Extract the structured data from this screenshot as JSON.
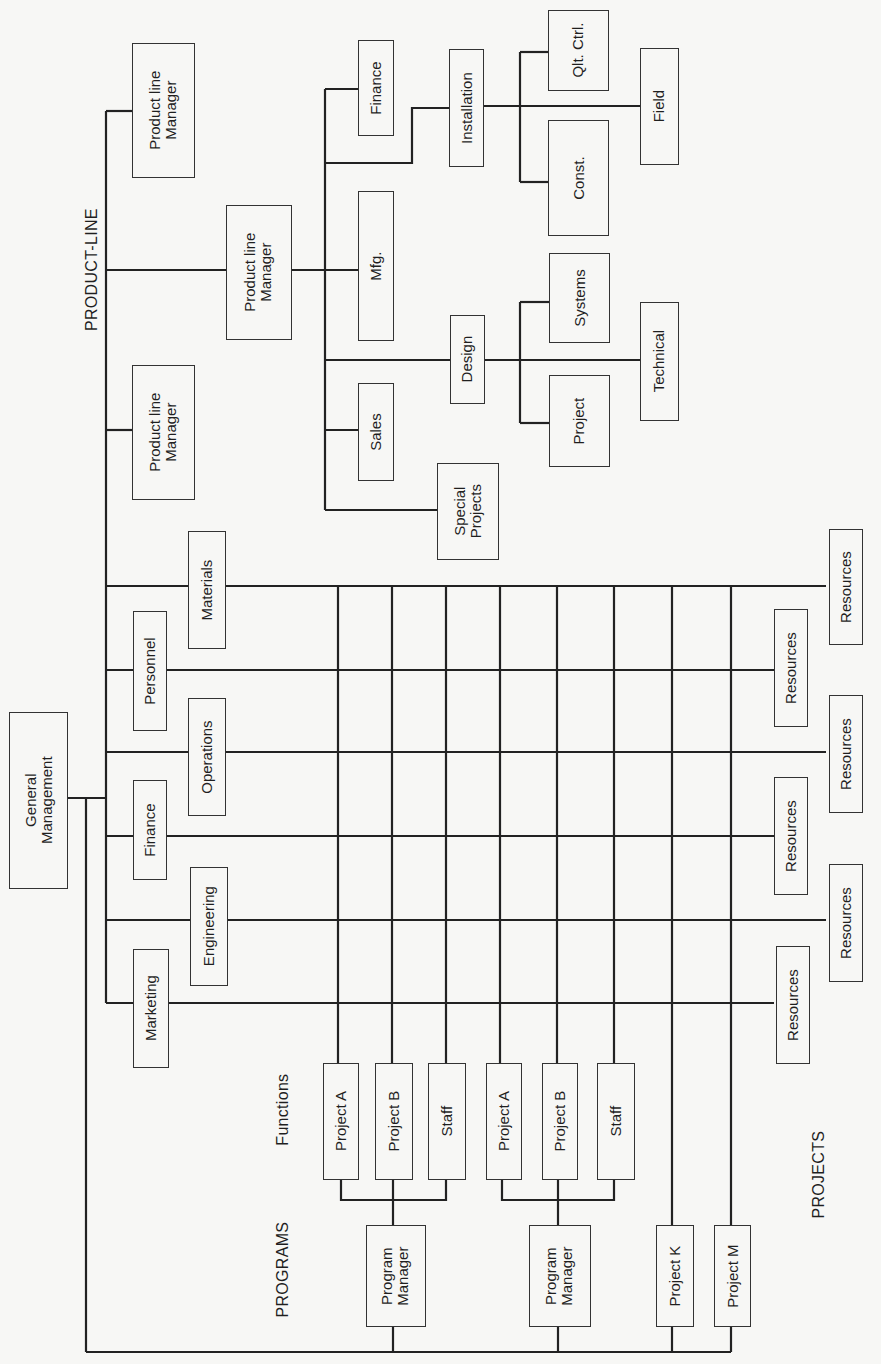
{
  "diagram": {
    "type": "matrix-org-chart",
    "section_labels": {
      "product_line": "PRODUCT-LINE",
      "programs": "PROGRAMS",
      "functions": "Functions",
      "projects": "PROJECTS"
    },
    "root": {
      "label": "General\nManagement"
    },
    "product_line": {
      "managers": [
        {
          "label": "Product line\nManager"
        },
        {
          "label": "Product line\nManager"
        },
        {
          "label": "Product line\nManager"
        }
      ],
      "departments": [
        {
          "label": "Finance"
        },
        {
          "label": "Mfg."
        },
        {
          "label": "Sales"
        },
        {
          "label": "Special\nProjects"
        },
        {
          "label": "Design"
        },
        {
          "label": "Installation"
        }
      ],
      "design_units": [
        {
          "label": "Systems"
        },
        {
          "label": "Project"
        },
        {
          "label": "Technical"
        }
      ],
      "installation_units": [
        {
          "label": "Qlt. Ctrl."
        },
        {
          "label": "Const."
        },
        {
          "label": "Field"
        }
      ]
    },
    "functions": [
      {
        "label": "Materials"
      },
      {
        "label": "Personnel"
      },
      {
        "label": "Operations"
      },
      {
        "label": "Finance"
      },
      {
        "label": "Engineering"
      },
      {
        "label": "Marketing"
      }
    ],
    "resources": [
      {
        "label": "Resources"
      },
      {
        "label": "Resources"
      },
      {
        "label": "Resources"
      },
      {
        "label": "Resources"
      },
      {
        "label": "Resources"
      },
      {
        "label": "Resources"
      }
    ],
    "programs": [
      {
        "manager": "Program\nManager",
        "units": [
          {
            "label": "Project A"
          },
          {
            "label": "Project B"
          },
          {
            "label": "Staff"
          }
        ]
      },
      {
        "manager": "Program\nManager",
        "units": [
          {
            "label": "Project A"
          },
          {
            "label": "Project B"
          },
          {
            "label": "Staff"
          }
        ]
      }
    ],
    "projects": [
      {
        "label": "Project K"
      },
      {
        "label": "Project M"
      }
    ]
  }
}
